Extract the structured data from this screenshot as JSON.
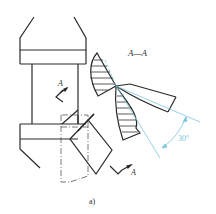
{
  "figure": {
    "caption": "a)",
    "section_label": "A—A",
    "section_marker_top": "A",
    "section_marker_bottom": "A",
    "angle_label": "30°"
  },
  "colors": {
    "line": "#2a2a2a",
    "dimension": "#7cc6dd",
    "hatch": "#333333",
    "background": "#ffffff"
  }
}
